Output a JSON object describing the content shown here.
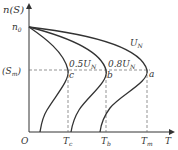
{
  "diagram": {
    "type": "induction motor mechanical characteristic curves n(S) vs T at different voltages",
    "y_axis_label": "n(S)",
    "x_axis_label": "T",
    "origin_label": "O",
    "n0_label": "n",
    "n0_sub": "0",
    "sm_label_open": "(S",
    "sm_label_sub": "m",
    "sm_label_close": ")",
    "curves": [
      {
        "name": "U_N",
        "label": "U",
        "sub": "N",
        "point": "a"
      },
      {
        "name": "0.8U_N",
        "label": "0.8U",
        "sub": "N",
        "point": "b"
      },
      {
        "name": "0.5U_N",
        "label": "0.5U",
        "sub": "N",
        "point": "c"
      }
    ],
    "x_ticks": [
      {
        "label": "T",
        "sub": "c"
      },
      {
        "label": "T",
        "sub": "b"
      },
      {
        "label": "T",
        "sub": "m"
      }
    ],
    "colors": {
      "curve": "#333333",
      "dashed": "#666666"
    }
  }
}
